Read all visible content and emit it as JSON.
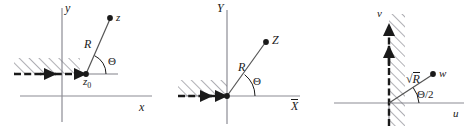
{
  "figure": {
    "type": "diagram",
    "panels": [
      {
        "id": "z-plane",
        "axis_vertical_label": "y",
        "axis_horizontal_label": "x",
        "point_label": "z",
        "radius_label": "R",
        "angle_label": "Θ",
        "origin_point_label": "z",
        "origin_point_subscript": "0",
        "has_hatched_halfline": true,
        "hatch_side": "above"
      },
      {
        "id": "Z-plane",
        "axis_vertical_label": "Y",
        "axis_horizontal_label": "X",
        "axis_horizontal_overline": true,
        "point_label": "Z",
        "radius_label": "R",
        "angle_label": "Θ",
        "has_hatched_halfline": true,
        "hatch_side": "above"
      },
      {
        "id": "w-plane",
        "axis_vertical_label": "v",
        "axis_horizontal_label": "u",
        "point_label": "w",
        "radius_label": "R",
        "radius_prefix": "√",
        "radius_overline": true,
        "angle_label": "Θ/2",
        "has_hatched_halfline": true,
        "hatch_side": "right-of-vertical"
      }
    ],
    "colors": {
      "axis": "#8c8c94",
      "ink": "#1a1a1a",
      "hatch": "#6e6e76",
      "background": "#ffffff"
    }
  }
}
